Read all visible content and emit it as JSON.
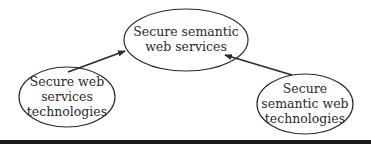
{
  "diagram": {
    "nodes": [
      {
        "id": "secure-semantic-web-services",
        "lines": [
          "Secure semantic",
          "web services"
        ]
      },
      {
        "id": "secure-web-services-technologies",
        "lines": [
          "Secure web",
          "services",
          "technologies"
        ]
      },
      {
        "id": "secure-semantic-web-technologies",
        "lines": [
          "Secure",
          "semantic web",
          "technologies"
        ]
      }
    ],
    "edges": [
      {
        "from": "secure-web-services-technologies",
        "to": "secure-semantic-web-services"
      },
      {
        "from": "secure-semantic-web-technologies",
        "to": "secure-semantic-web-services"
      }
    ],
    "colors": {
      "stroke": "#2a2a2a",
      "text": "#2a2a2a",
      "background": "#ffffff",
      "bottom_rule": "#1a1a1a"
    }
  }
}
